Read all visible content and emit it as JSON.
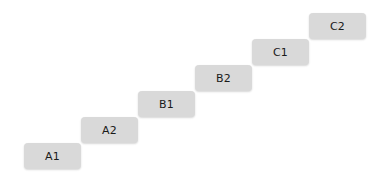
{
  "canvas": {
    "width": 385,
    "height": 184,
    "background_color": "#ffffff"
  },
  "diagram": {
    "name": "staircase-step-diagram",
    "node_fill_color": "#d9d9d9",
    "node_text_color": "#1a1a1a",
    "node_shadow_color": "rgba(0,0,0,0.16)",
    "node_width": 57,
    "node_height": 26,
    "step_x_offset": 57,
    "step_y_offset": 26,
    "nodes": [
      {
        "label": "A1",
        "x": 24,
        "y": 143
      },
      {
        "label": "A2",
        "x": 81,
        "y": 117
      },
      {
        "label": "B1",
        "x": 138,
        "y": 91
      },
      {
        "label": "B2",
        "x": 195,
        "y": 65
      },
      {
        "label": "C1",
        "x": 252,
        "y": 39
      },
      {
        "label": "C2",
        "x": 309,
        "y": 13
      }
    ]
  }
}
